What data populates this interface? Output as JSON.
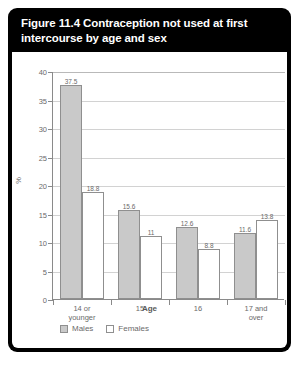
{
  "figure": {
    "title": "Figure 11.4 Contraception not used at first intercourse by age and sex"
  },
  "legend": {
    "items": [
      {
        "label": "Males",
        "swatch": "males-swatch",
        "color": "#c9c9c9"
      },
      {
        "label": "Females",
        "swatch": "females-swatch",
        "color": "#ffffff"
      }
    ]
  },
  "chart_data": {
    "type": "bar",
    "title": "Figure 11.4 Contraception not used at first intercourse by age and sex",
    "categories": [
      "14 or younger",
      "15",
      "16",
      "17 and over"
    ],
    "series": [
      {
        "name": "Males",
        "values": [
          37.5,
          15.6,
          12.6,
          11.6
        ],
        "color": "#c9c9c9"
      },
      {
        "name": "Females",
        "values": [
          18.8,
          11,
          8.8,
          13.8
        ],
        "color": "#ffffff"
      }
    ],
    "xlabel": "Age",
    "ylabel": "%",
    "ylim": [
      0,
      40
    ],
    "yticks": [
      0,
      5,
      10,
      15,
      20,
      25,
      30,
      35,
      40
    ],
    "grid": true,
    "legend_position": "bottom-left"
  }
}
